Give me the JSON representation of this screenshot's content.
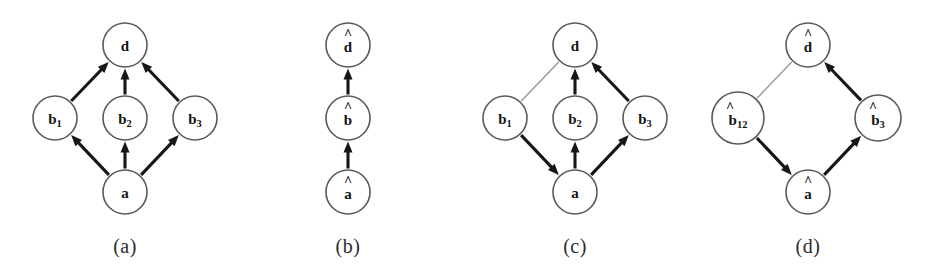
{
  "figure": {
    "type": "directed-graph-panels",
    "background": "#ffffff",
    "edge_color_solid": "#171717",
    "edge_color_faint": "#9b9b9b",
    "node_stroke": "#5a5a5a",
    "node_fill": "#ffffff",
    "width": 945,
    "height": 274
  },
  "panels": [
    {
      "id": "a",
      "caption": "(a)",
      "caption_pos": {
        "x": 125,
        "y": 246
      },
      "nodes": [
        {
          "id": "d",
          "label": "d",
          "sub": "",
          "hat": false,
          "cx": 125,
          "cy": 45,
          "r": 22
        },
        {
          "id": "b1",
          "label": "b",
          "sub": "1",
          "hat": false,
          "cx": 55,
          "cy": 118,
          "r": 22
        },
        {
          "id": "b2",
          "label": "b",
          "sub": "2",
          "hat": false,
          "cx": 125,
          "cy": 118,
          "r": 22
        },
        {
          "id": "b3",
          "label": "b",
          "sub": "3",
          "hat": false,
          "cx": 195,
          "cy": 118,
          "r": 22
        },
        {
          "id": "a",
          "label": "a",
          "sub": "",
          "hat": false,
          "cx": 125,
          "cy": 192,
          "r": 22
        }
      ],
      "edges": [
        {
          "from": "b1",
          "to": "d",
          "style": "solid",
          "arrow": true
        },
        {
          "from": "b2",
          "to": "d",
          "style": "solid",
          "arrow": true
        },
        {
          "from": "b3",
          "to": "d",
          "style": "solid",
          "arrow": true
        },
        {
          "from": "a",
          "to": "b1",
          "style": "solid",
          "arrow": true
        },
        {
          "from": "a",
          "to": "b2",
          "style": "solid",
          "arrow": true
        },
        {
          "from": "a",
          "to": "b3",
          "style": "solid",
          "arrow": true
        }
      ]
    },
    {
      "id": "b",
      "caption": "(b)",
      "caption_pos": {
        "x": 348,
        "y": 246
      },
      "nodes": [
        {
          "id": "dh",
          "label": "d",
          "sub": "",
          "hat": true,
          "cx": 348,
          "cy": 45,
          "r": 22
        },
        {
          "id": "bh",
          "label": "b",
          "sub": "",
          "hat": true,
          "cx": 348,
          "cy": 118,
          "r": 22
        },
        {
          "id": "ah",
          "label": "a",
          "sub": "",
          "hat": true,
          "cx": 348,
          "cy": 192,
          "r": 22
        }
      ],
      "edges": [
        {
          "from": "bh",
          "to": "dh",
          "style": "solid",
          "arrow": true
        },
        {
          "from": "ah",
          "to": "bh",
          "style": "solid",
          "arrow": true
        }
      ]
    },
    {
      "id": "c",
      "caption": "(c)",
      "caption_pos": {
        "x": 575,
        "y": 246
      },
      "nodes": [
        {
          "id": "d",
          "label": "d",
          "sub": "",
          "hat": false,
          "cx": 575,
          "cy": 45,
          "r": 22
        },
        {
          "id": "b1",
          "label": "b",
          "sub": "1",
          "hat": false,
          "cx": 505,
          "cy": 118,
          "r": 22
        },
        {
          "id": "b2",
          "label": "b",
          "sub": "2",
          "hat": false,
          "cx": 575,
          "cy": 118,
          "r": 22
        },
        {
          "id": "b3",
          "label": "b",
          "sub": "3",
          "hat": false,
          "cx": 645,
          "cy": 118,
          "r": 22
        },
        {
          "id": "a",
          "label": "a",
          "sub": "",
          "hat": false,
          "cx": 575,
          "cy": 192,
          "r": 22
        }
      ],
      "edges": [
        {
          "from": "b1",
          "to": "d",
          "style": "faint",
          "arrow": false
        },
        {
          "from": "b2",
          "to": "d",
          "style": "solid",
          "arrow": true
        },
        {
          "from": "b3",
          "to": "d",
          "style": "solid",
          "arrow": true
        },
        {
          "from": "b1",
          "to": "a",
          "style": "solid",
          "arrow": true
        },
        {
          "from": "a",
          "to": "b2",
          "style": "solid",
          "arrow": true
        },
        {
          "from": "a",
          "to": "b3",
          "style": "solid",
          "arrow": true
        }
      ]
    },
    {
      "id": "d",
      "caption": "(d)",
      "caption_pos": {
        "x": 808,
        "y": 246
      },
      "nodes": [
        {
          "id": "dh",
          "label": "d",
          "sub": "",
          "hat": true,
          "cx": 808,
          "cy": 45,
          "r": 22
        },
        {
          "id": "b12h",
          "label": "b",
          "sub": "12",
          "hat": true,
          "cx": 738,
          "cy": 118,
          "r": 26
        },
        {
          "id": "b3h",
          "label": "b",
          "sub": "3",
          "hat": true,
          "cx": 878,
          "cy": 118,
          "r": 23
        },
        {
          "id": "ah",
          "label": "a",
          "sub": "",
          "hat": true,
          "cx": 808,
          "cy": 192,
          "r": 22
        }
      ],
      "edges": [
        {
          "from": "b12h",
          "to": "dh",
          "style": "faint",
          "arrow": false
        },
        {
          "from": "b3h",
          "to": "dh",
          "style": "solid",
          "arrow": true
        },
        {
          "from": "b12h",
          "to": "ah",
          "style": "solid",
          "arrow": true
        },
        {
          "from": "ah",
          "to": "b3h",
          "style": "solid",
          "arrow": true
        }
      ]
    }
  ]
}
